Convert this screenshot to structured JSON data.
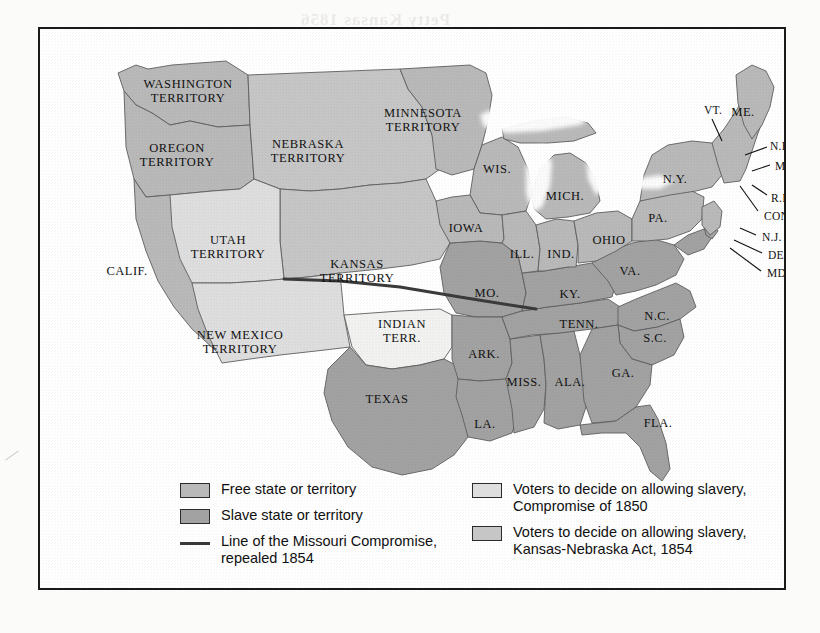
{
  "document": {
    "kind": "historical-map",
    "subject": "United States slave and free states and territories, 1854",
    "bleed_text": "Petty Kansas 1856"
  },
  "colors": {
    "free": "#b9b9b9",
    "slave": "#a2a2a2",
    "compromise_1850": "#dedede",
    "kansas_nebraska": "#c6c6c6",
    "indian_territory": "#f2f2f0",
    "water": "#ffffff",
    "border_stroke": "#5f5f5f",
    "outline": "#3c3c3c",
    "compromise_line": "#3a3a3a",
    "frame": "#1a1a1a",
    "label_text": "#111111"
  },
  "legend": {
    "left_column": [
      {
        "symbol": "swatch",
        "fill_key": "free",
        "label": "Free state or territory"
      },
      {
        "symbol": "swatch",
        "fill_key": "slave",
        "label": "Slave state or territory"
      },
      {
        "symbol": "line",
        "fill_key": "compromise_line",
        "label": "Line of the Missouri Compromise,\nrepealed 1854"
      }
    ],
    "right_column": [
      {
        "symbol": "swatch",
        "fill_key": "compromise_1850",
        "label": "Voters to decide on allowing slavery,\nCompromise of 1850"
      },
      {
        "symbol": "swatch",
        "fill_key": "kansas_nebraska",
        "label": "Voters to decide on allowing slavery,\nKansas-Nebraska Act, 1854"
      }
    ]
  },
  "map_labels": {
    "territories": [
      {
        "name": "washington-territory",
        "text": "WASHINGTON\nTERRITORY",
        "x": 148,
        "y": 63,
        "category": "free"
      },
      {
        "name": "oregon-territory",
        "text": "OREGON\nTERRITORY",
        "x": 137,
        "y": 127,
        "category": "free"
      },
      {
        "name": "nebraska-territory",
        "text": "NEBRASKA\nTERRITORY",
        "x": 268,
        "y": 123,
        "category": "kansas_nebraska"
      },
      {
        "name": "minnesota-territory",
        "text": "MINNESOTA\nTERRITORY",
        "x": 383,
        "y": 92,
        "category": "free"
      },
      {
        "name": "utah-territory",
        "text": "UTAH\nTERRITORY",
        "x": 188,
        "y": 219,
        "category": "compromise_1850"
      },
      {
        "name": "kansas-territory",
        "text": "KANSAS\nTERRITORY",
        "x": 317,
        "y": 243,
        "category": "kansas_nebraska"
      },
      {
        "name": "new-mexico-territory",
        "text": "NEW MEXICO\nTERRITORY",
        "x": 200,
        "y": 314,
        "category": "compromise_1850"
      },
      {
        "name": "indian-territory",
        "text": "INDIAN\nTERR.",
        "x": 362,
        "y": 303,
        "category": "indian_territory"
      }
    ],
    "states": [
      {
        "name": "california",
        "text": "CALIF.",
        "x": 87,
        "y": 243,
        "category": "free"
      },
      {
        "name": "texas",
        "text": "TEXAS",
        "x": 347,
        "y": 371,
        "category": "slave"
      },
      {
        "name": "wisconsin",
        "text": "WIS.",
        "x": 457,
        "y": 141,
        "category": "free"
      },
      {
        "name": "michigan",
        "text": "MICH.",
        "x": 525,
        "y": 168,
        "category": "free"
      },
      {
        "name": "iowa",
        "text": "IOWA",
        "x": 426,
        "y": 200,
        "category": "free"
      },
      {
        "name": "illinois",
        "text": "ILL.",
        "x": 482,
        "y": 226,
        "category": "free"
      },
      {
        "name": "indiana",
        "text": "IND.",
        "x": 521,
        "y": 226,
        "category": "free"
      },
      {
        "name": "ohio",
        "text": "OHIO",
        "x": 569,
        "y": 212,
        "category": "free"
      },
      {
        "name": "missouri",
        "text": "MO.",
        "x": 447,
        "y": 265,
        "category": "slave"
      },
      {
        "name": "kentucky",
        "text": "KY.",
        "x": 530,
        "y": 266,
        "category": "slave"
      },
      {
        "name": "tennessee",
        "text": "TENN.",
        "x": 539,
        "y": 296,
        "category": "slave"
      },
      {
        "name": "arkansas",
        "text": "ARK.",
        "x": 444,
        "y": 326,
        "category": "slave"
      },
      {
        "name": "mississippi",
        "text": "MISS.",
        "x": 484,
        "y": 354,
        "category": "slave"
      },
      {
        "name": "alabama",
        "text": "ALA.",
        "x": 530,
        "y": 354,
        "category": "slave"
      },
      {
        "name": "georgia",
        "text": "GA.",
        "x": 583,
        "y": 345,
        "category": "slave"
      },
      {
        "name": "louisiana",
        "text": "LA.",
        "x": 445,
        "y": 396,
        "category": "slave"
      },
      {
        "name": "florida",
        "text": "FLA.",
        "x": 618,
        "y": 395,
        "category": "slave"
      },
      {
        "name": "south-carolina",
        "text": "S.C.",
        "x": 615,
        "y": 310,
        "category": "slave"
      },
      {
        "name": "north-carolina",
        "text": "N.C.",
        "x": 617,
        "y": 288,
        "category": "slave"
      },
      {
        "name": "virginia",
        "text": "VA.",
        "x": 590,
        "y": 243,
        "category": "slave"
      },
      {
        "name": "pennsylvania",
        "text": "PA.",
        "x": 618,
        "y": 190,
        "category": "free"
      },
      {
        "name": "new-york",
        "text": "N.Y.",
        "x": 635,
        "y": 151,
        "category": "free"
      },
      {
        "name": "maine",
        "text": "ME.",
        "x": 703,
        "y": 84,
        "category": "free"
      }
    ],
    "leader_labels": [
      {
        "name": "vermont",
        "text": "VT.",
        "lx": 664,
        "ly": 82,
        "x1": 672,
        "y1": 90,
        "x2": 682,
        "y2": 112
      },
      {
        "name": "new-hampshire",
        "text": "N.H.",
        "lx": 730,
        "ly": 118,
        "x1": 727,
        "y1": 118,
        "x2": 705,
        "y2": 126
      },
      {
        "name": "massachusetts",
        "text": "MASS.",
        "lx": 735,
        "ly": 138,
        "x1": 730,
        "y1": 136,
        "x2": 712,
        "y2": 142
      },
      {
        "name": "rhode-island",
        "text": "R.I.",
        "lx": 731,
        "ly": 170,
        "x1": 727,
        "y1": 166,
        "x2": 712,
        "y2": 156
      },
      {
        "name": "connecticut",
        "text": "CONN.",
        "lx": 724,
        "ly": 188,
        "x1": 718,
        "y1": 182,
        "x2": 700,
        "y2": 157
      },
      {
        "name": "new-jersey",
        "text": "N.J.",
        "lx": 722,
        "ly": 209,
        "x1": 716,
        "y1": 206,
        "x2": 700,
        "y2": 199
      },
      {
        "name": "delaware",
        "text": "DEL.",
        "lx": 728,
        "ly": 227,
        "x1": 722,
        "y1": 224,
        "x2": 694,
        "y2": 211
      },
      {
        "name": "maryland",
        "text": "MD.",
        "lx": 727,
        "ly": 245,
        "x1": 721,
        "y1": 242,
        "x2": 690,
        "y2": 219
      }
    ]
  }
}
